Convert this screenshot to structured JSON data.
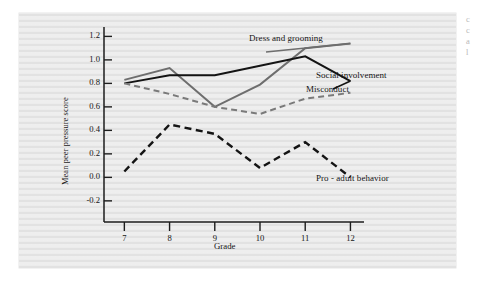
{
  "figure": {
    "background_color": "#efefef",
    "page_color": "#ffffff"
  },
  "axes": {
    "ylabel": "Mean peer pressure score",
    "xlabel": "Grade",
    "yticks": [
      "1.2",
      "1.0",
      "0.8",
      "0.6",
      "0.4",
      "0.2",
      "0.0",
      "-0.2"
    ],
    "xticks": [
      "7",
      "8",
      "9",
      "10",
      "11",
      "12"
    ]
  },
  "series_labels": {
    "dress": "Dress and grooming",
    "social": "Social involvement",
    "misconduct": "Misconduct",
    "proadult": "Pro - adult behavior"
  },
  "margin_note": {
    "line1": "c",
    "line2": "c",
    "line3": "a",
    "line4": "l"
  },
  "chart_data": {
    "type": "line",
    "title": "",
    "xlabel": "Grade",
    "ylabel": "Mean peer pressure score",
    "x": [
      7,
      8,
      9,
      10,
      11,
      12
    ],
    "xlim": [
      6.55,
      12.3
    ],
    "ylim": [
      -0.38,
      1.28
    ],
    "ytick_values": [
      1.2,
      1.0,
      0.8,
      0.6,
      0.4,
      0.2,
      0.0,
      -0.2
    ],
    "grid": false,
    "legend": "inline-right-labels",
    "series": [
      {
        "name": "Dress and grooming",
        "color": "#6e6e6e",
        "style": "solid",
        "width": 2.0,
        "values": [
          0.83,
          0.93,
          0.6,
          0.79,
          1.1,
          1.14
        ]
      },
      {
        "name": "Social involvement",
        "color": "#141414",
        "style": "solid",
        "width": 2.0,
        "values": [
          0.8,
          0.87,
          0.87,
          0.95,
          1.03,
          0.82
        ]
      },
      {
        "name": "Misconduct",
        "color": "#7a7a7a",
        "style": "dashed",
        "width": 2.0,
        "values": [
          0.8,
          0.71,
          0.6,
          0.54,
          0.67,
          0.72
        ]
      },
      {
        "name": "Pro - adult behavior",
        "color": "#141414",
        "style": "dashed",
        "width": 2.4,
        "values": [
          0.05,
          0.45,
          0.37,
          0.08,
          0.3,
          0.0
        ]
      }
    ]
  }
}
